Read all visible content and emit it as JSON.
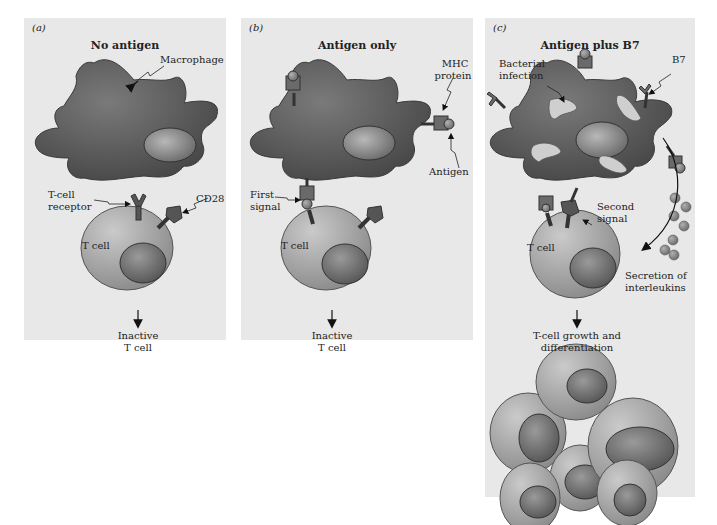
{
  "panels": [
    {
      "id": "a",
      "label": "(a)",
      "title": "No antigen",
      "annotations": {
        "macrophage": "Macrophage",
        "tcell_receptor_line1": "T-cell",
        "tcell_receptor_line2": "receptor",
        "cd28": "CD28",
        "tcell": "T cell"
      },
      "outcome_line1": "Inactive",
      "outcome_line2": "T cell"
    },
    {
      "id": "b",
      "label": "(b)",
      "title": "Antigen only",
      "annotations": {
        "mhc_line1": "MHC",
        "mhc_line2": "protein",
        "antigen": "Antigen",
        "first_signal_line1": "First",
        "first_signal_line2": "signal",
        "tcell": "T cell"
      },
      "outcome_line1": "Inactive",
      "outcome_line2": "T cell"
    },
    {
      "id": "c",
      "label": "(c)",
      "title": "Antigen plus B7",
      "annotations": {
        "bacterial_line1": "Bacterial",
        "bacterial_line2": "infection",
        "b7": "B7",
        "second_signal_line1": "Second",
        "second_signal_line2": "signal",
        "tcell": "T cell",
        "secretion_line1": "Secretion of",
        "secretion_line2": "interleukins"
      },
      "outcome_line1": "T-cell growth and",
      "outcome_line2": "differentiation"
    }
  ],
  "colors": {
    "panel_bg": "#e8e8e8",
    "macrophage": "#5a5a5a",
    "tcell": "#a8a8a8",
    "nucleus": "#7a7a7a",
    "bacteria": "#d0d0d0"
  }
}
